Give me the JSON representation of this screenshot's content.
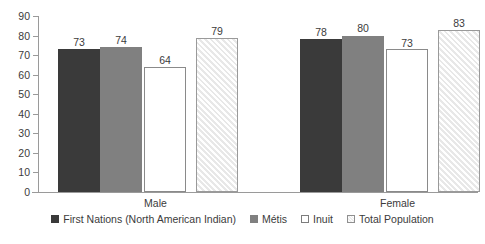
{
  "chart_data": {
    "type": "bar",
    "title": "",
    "subtitle": "",
    "xlabel": "",
    "ylabel": "",
    "ylim": [
      0,
      90
    ],
    "ytick_step": 10,
    "yticks": [
      90,
      80,
      70,
      60,
      50,
      40,
      30,
      20,
      10,
      0
    ],
    "grid": false,
    "legend_position": "bottom-center",
    "categories": [
      "Male",
      "Female"
    ],
    "series": [
      {
        "name": "First Nations (North American Indian)",
        "color": "#3a3a3a",
        "fill": "solid",
        "values": [
          73,
          78
        ]
      },
      {
        "name": "Métis",
        "color": "#808080",
        "fill": "solid",
        "values": [
          74,
          80
        ]
      },
      {
        "name": "Inuit",
        "color": "#ffffff",
        "fill": "outline",
        "values": [
          64,
          73
        ]
      },
      {
        "name": "Total Population",
        "color": "#e8e8e8",
        "fill": "diagonal-hatch",
        "values": [
          79,
          83
        ]
      }
    ]
  },
  "legend": {
    "items": [
      {
        "label": "First Nations (North American Indian)",
        "swatch": "first-nations"
      },
      {
        "label": "Métis",
        "swatch": "metis"
      },
      {
        "label": "Inuit",
        "swatch": "inuit"
      },
      {
        "label": "Total Population",
        "swatch": "total-population"
      }
    ]
  },
  "axis": {
    "y_tick_labels": [
      "90",
      "80",
      "70",
      "60",
      "50",
      "40",
      "30",
      "20",
      "10",
      "0"
    ],
    "x_tick_labels": [
      "Male",
      "Female"
    ]
  }
}
